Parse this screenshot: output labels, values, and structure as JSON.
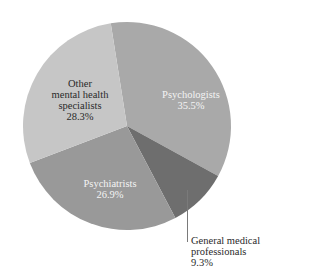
{
  "chart_data": {
    "type": "pie",
    "title": "",
    "start_angle_deg": -9,
    "direction": "clockwise",
    "slices": [
      {
        "label": "Psychologists",
        "value": 35.5,
        "value_label": "35.5%",
        "color": "#a9a9a9"
      },
      {
        "label": "General medical professionals",
        "value": 9.3,
        "value_label": "9.3%",
        "color": "#6e6e6e"
      },
      {
        "label": "Psychiatrists",
        "value": 26.9,
        "value_label": "26.9%",
        "color": "#999999"
      },
      {
        "label": "Other mental health specialists",
        "value": 28.3,
        "value_label": "28.3%",
        "color": "#c6c6c6"
      }
    ],
    "legend": "none",
    "label_position": "inside (General medical professionals outside with leader line)"
  },
  "labels": {
    "psychologists": {
      "line1": "Psychologists",
      "pct": "35.5%"
    },
    "general": {
      "line1": "General medical",
      "line2": "professionals",
      "pct": "9.3%"
    },
    "psychiatrists": {
      "line1": "Psychiatrists",
      "pct": "26.9%"
    },
    "other": {
      "line1": "Other",
      "line2": "mental health",
      "line3": "specialists",
      "pct": "28.3%"
    }
  }
}
